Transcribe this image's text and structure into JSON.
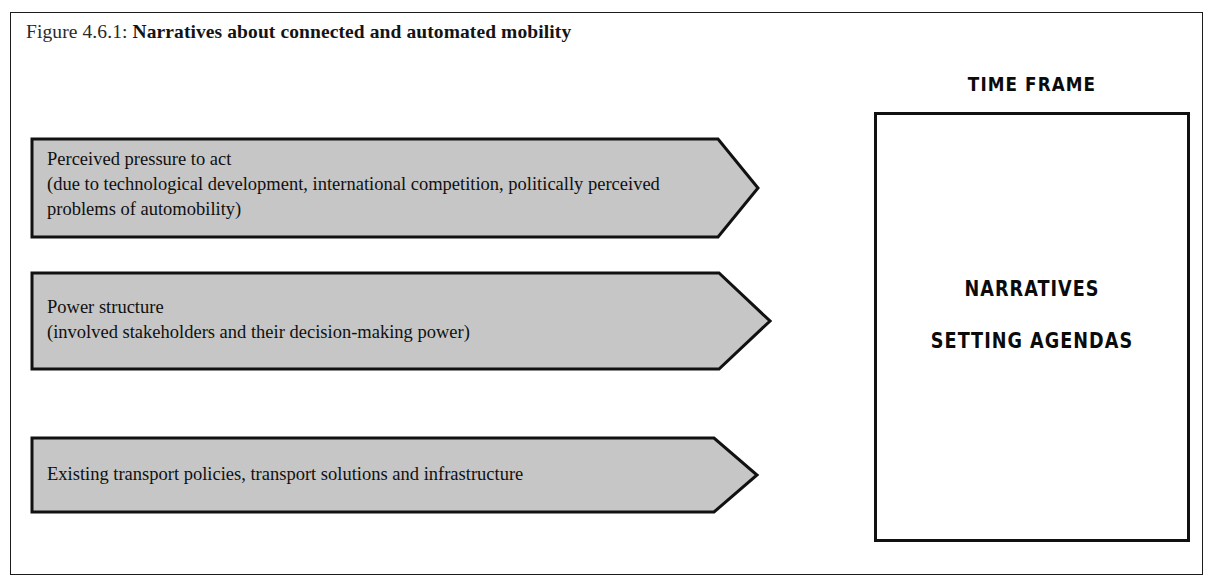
{
  "figure": {
    "caption_label": "Figure 4.6.1:",
    "caption_title": "Narratives about connected and automated mobility"
  },
  "arrows": [
    {
      "name": "perceived-pressure-to-act",
      "lines": [
        "Perceived pressure to act",
        "(due to technological development, international competition, politically perceived",
        "problems of automobility)"
      ]
    },
    {
      "name": "power-structure",
      "lines": [
        "Power structure",
        "(involved stakeholders and their decision-making power)"
      ]
    },
    {
      "name": "existing-transport-policies",
      "lines": [
        "Existing transport policies, transport solutions and infrastructure"
      ]
    }
  ],
  "timeframe": {
    "title": "TIME FRAME",
    "line1": "NARRATIVES",
    "line2": "SETTING AGENDAS"
  },
  "colors": {
    "arrow_fill": "#c6c6c6",
    "outline": "#111111",
    "frame": "#1c1c1c",
    "page_background": "#ffffff",
    "text": "#101010"
  }
}
